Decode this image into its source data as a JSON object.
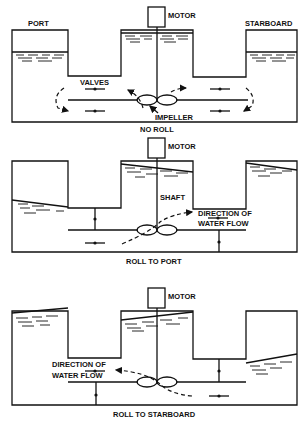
{
  "panels": [
    {
      "id": "no-roll",
      "caption": "NO ROLL",
      "labels": {
        "port": "PORT",
        "starboard": "STARBOARD",
        "motor": "MOTOR",
        "valves": "VALVES",
        "impeller": "IMPELLER"
      }
    },
    {
      "id": "roll-to-port",
      "caption": "ROLL TO PORT",
      "labels": {
        "motor": "MOTOR",
        "shaft": "SHAFT",
        "flow_line1": "DIRECTION OF",
        "flow_line2": "WATER FLOW"
      }
    },
    {
      "id": "roll-to-starboard",
      "caption": "ROLL TO STARBOARD",
      "labels": {
        "motor": "MOTOR",
        "flow_line1": "DIRECTION OF",
        "flow_line2": "WATER FLOW"
      }
    }
  ]
}
